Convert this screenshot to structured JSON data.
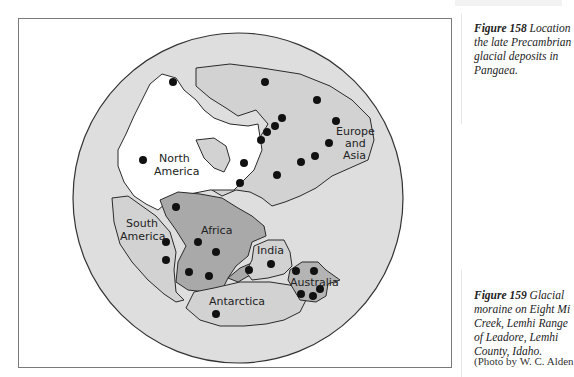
{
  "figure158": {
    "number": "Figure 158",
    "caption": "Location of the late Precambrian glacial deposits in Pangaea.",
    "caption_visible_lines": [
      "Location",
      "the late Precambrian",
      "glacial deposits in",
      "Pangaea."
    ]
  },
  "figure159": {
    "number": "Figure 159",
    "caption_visible_lines": [
      "Glacial",
      "moraine on Eight Mi",
      "Creek, Lemhi Range",
      "of Leadore, Lemhi",
      "County, Idaho."
    ],
    "credit": "(Photo by W. C. Alden"
  },
  "map": {
    "labels": {
      "north_america": [
        "North",
        "America"
      ],
      "europe_asia": [
        "Europe",
        "and",
        "Asia"
      ],
      "south_america": [
        "South",
        "America"
      ],
      "africa": "Africa",
      "india": "India",
      "antarctica": "Antarctica",
      "australia": "Australia"
    },
    "colors": {
      "ocean": "#dedede",
      "north_america": "#ffffff",
      "light_land": "#d2d2d2",
      "africa": "#a9a9a9",
      "australia": "#b4b4b4",
      "outline": "#2a2a2a",
      "deposit_dot": "#111111"
    },
    "legend": "Dots mark late Precambrian glacial deposits"
  }
}
